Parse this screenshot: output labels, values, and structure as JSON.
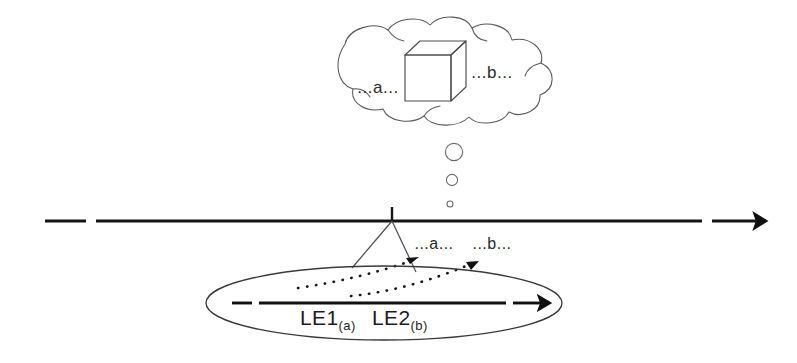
{
  "diagram": {
    "background_color": "#ffffff",
    "ink_color": "#151515",
    "outline_color": "#58585a"
  },
  "cloud": {
    "name": "thought-cloud",
    "label_left": "...a...",
    "label_right": "...b...",
    "cube_label": "cube"
  },
  "thought_bubbles": {
    "name": "thought-bubble-trail",
    "count": 3,
    "sizes": [
      9,
      6,
      3.2
    ]
  },
  "timeline": {
    "name": "timeline-axis",
    "arrow_direction": "right",
    "tick_label": "",
    "has_left_dash": true,
    "has_arrowhead": true
  },
  "projection": {
    "name": "projection-cone",
    "label_a": "...a...",
    "label_b": "...b..."
  },
  "ellipse": {
    "name": "utterance-ellipse",
    "inner_arrow_direction": "right",
    "expressions": [
      {
        "base": "LE1",
        "sub": "(a)"
      },
      {
        "base": "LE2",
        "sub": "(b)"
      }
    ]
  }
}
